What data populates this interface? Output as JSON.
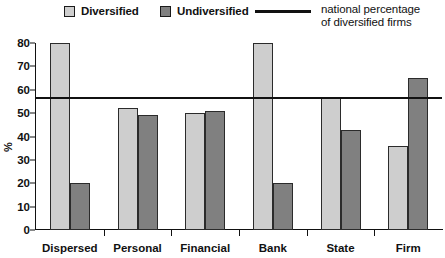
{
  "legend": {
    "entries": [
      {
        "label": "Diversified",
        "marker": "light-square-swatch",
        "color": "#cecece"
      },
      {
        "label": "Undiversified",
        "marker": "dark-square-swatch",
        "color": "#808080"
      }
    ],
    "reference": {
      "line1": "national percentage",
      "line2": "of diversified firms",
      "marker": "horizontal-line-swatch",
      "color": "#111111"
    }
  },
  "axes": {
    "ylabel": "%",
    "yticks": [
      "0",
      "10",
      "20",
      "30",
      "40",
      "50",
      "60",
      "70",
      "80"
    ]
  },
  "chart_data": {
    "type": "bar",
    "title": "",
    "xlabel": "",
    "ylabel": "%",
    "ylim": [
      0,
      80
    ],
    "yticks": [
      0,
      10,
      20,
      30,
      40,
      50,
      60,
      70,
      80
    ],
    "grid": false,
    "legend_position": "top",
    "categories": [
      "Dispersed",
      "Personal",
      "Financial",
      "Bank",
      "State",
      "Firm"
    ],
    "series": [
      {
        "name": "Diversified",
        "color": "#cecece",
        "values": [
          80,
          52,
          50,
          80,
          57,
          36
        ]
      },
      {
        "name": "Undiversified",
        "color": "#808080",
        "values": [
          20,
          49,
          51,
          20,
          43,
          65
        ]
      }
    ],
    "reference_lines": [
      {
        "name": "national percentage of diversified firms",
        "value": 56,
        "color": "#111111",
        "orientation": "horizontal"
      }
    ]
  }
}
